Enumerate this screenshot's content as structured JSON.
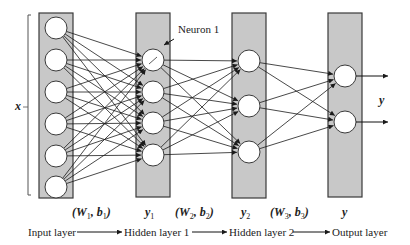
{
  "diagram": {
    "colors": {
      "layer_fill": "#c8c8c8",
      "layer_stroke": "#3a3a3a",
      "neuron_fill": "#ffffff",
      "neuron_stroke": "#3a3a3a",
      "edge": "#1a1a1a"
    },
    "input_bracket_label": "x",
    "output_label": "y",
    "neuron_annotation": "Neuron 1",
    "layers": [
      {
        "id": "input",
        "name": "Input layer",
        "box": [
          39,
          13,
          34,
          185
        ],
        "neuron_x": 56,
        "neurons_y": [
          28,
          60,
          92,
          124,
          156,
          187
        ]
      },
      {
        "id": "hidden1",
        "name": "Hidden layer 1",
        "box": [
          136,
          13,
          34,
          184
        ],
        "neuron_x": 153,
        "neurons_y": [
          60,
          92,
          123,
          155
        ]
      },
      {
        "id": "hidden2",
        "name": "Hidden layer 2",
        "box": [
          232,
          13,
          34,
          185
        ],
        "neuron_x": 249,
        "neurons_y": [
          61,
          106,
          152
        ]
      },
      {
        "id": "output",
        "name": "Output layer",
        "box": [
          328,
          13,
          34,
          184
        ],
        "neuron_x": 345,
        "neurons_y": [
          76,
          122
        ]
      }
    ],
    "neuron_radius": 11,
    "connections": "fully-connected between adjacent layers",
    "top_labels": [
      {
        "text_parts": [
          "(W",
          "1",
          ",  b",
          "1",
          ")"
        ],
        "x": 72
      },
      {
        "text_parts": [
          "y",
          "1"
        ],
        "x": 145
      },
      {
        "text_parts": [
          "(W",
          "2",
          ",  b",
          "2",
          ")"
        ],
        "x": 175
      },
      {
        "text_parts": [
          "y",
          "2"
        ],
        "x": 241
      },
      {
        "text_parts": [
          "(W",
          "3",
          ",  b",
          "3",
          ")"
        ],
        "x": 270
      },
      {
        "text_parts": [
          "y"
        ],
        "x": 342
      }
    ],
    "flow": {
      "stages": [
        "Input layer",
        "Hidden layer 1",
        "Hidden layer 2",
        "Output layer"
      ],
      "params": [
        "(W1, b1)",
        "(W2, b2)",
        "(W3, b3)"
      ],
      "outputs": [
        "y1",
        "y2",
        "y"
      ]
    }
  }
}
